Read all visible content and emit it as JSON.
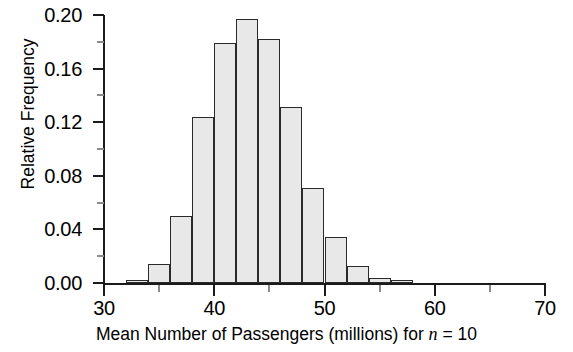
{
  "chart_data": {
    "type": "bar",
    "title": "",
    "subtitle": "",
    "xlabel": "Mean Number of Passengers (millions) for n = 10",
    "xlabel_plain": "Mean Number of Passengers (millions) for ",
    "xlabel_italic": "n",
    "xlabel_tail": " = 10",
    "ylabel": "Relative Frequency",
    "xlim": [
      30,
      70
    ],
    "ylim": [
      0.0,
      0.2
    ],
    "bin_width": 2,
    "grid": false,
    "legend": null,
    "x_ticks": [
      30,
      40,
      50,
      60,
      70
    ],
    "x_tick_labels": [
      "30",
      "40",
      "50",
      "60",
      "70"
    ],
    "x_minor_ticks": [
      35,
      45,
      55,
      65
    ],
    "y_ticks": [
      0.0,
      0.04,
      0.08,
      0.12,
      0.16,
      0.2
    ],
    "y_tick_labels": [
      "0.00",
      "0.04",
      "0.08",
      "0.12",
      "0.16",
      "0.20"
    ],
    "y_minor_ticks": [
      0.02,
      0.06,
      0.1,
      0.14,
      0.18
    ],
    "bin_edges": [
      30,
      32,
      34,
      36,
      38,
      40,
      42,
      44,
      46,
      48,
      50,
      52,
      54,
      56,
      58,
      60
    ],
    "categories": [
      "30-32",
      "32-34",
      "34-36",
      "36-38",
      "38-40",
      "40-42",
      "42-44",
      "44-46",
      "46-48",
      "48-50",
      "50-52",
      "52-54",
      "54-56",
      "56-58",
      "58-60"
    ],
    "values": [
      0.0,
      0.002,
      0.014,
      0.05,
      0.124,
      0.179,
      0.197,
      0.182,
      0.131,
      0.071,
      0.034,
      0.013,
      0.004,
      0.002,
      0.0
    ],
    "bar_fill_color": "#e8e8e8",
    "bar_edge_color": "#2a2a2a",
    "axis_color": "#1b1b1b",
    "background_color": "#ffffff"
  }
}
